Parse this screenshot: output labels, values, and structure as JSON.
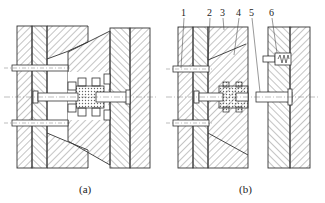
{
  "figure": {
    "type": "mold cross-section diagram",
    "panels": [
      {
        "id": "a",
        "caption": "(a)",
        "state": "mold closed"
      },
      {
        "id": "b",
        "caption": "(b)",
        "state": "mold open"
      }
    ],
    "callouts": [
      {
        "label": "1",
        "x": 183,
        "y": 13
      },
      {
        "label": "2",
        "x": 209,
        "y": 13
      },
      {
        "label": "3",
        "x": 222,
        "y": 13
      },
      {
        "label": "4",
        "x": 238,
        "y": 13
      },
      {
        "label": "5",
        "x": 251,
        "y": 13
      },
      {
        "label": "6",
        "x": 271,
        "y": 13
      }
    ],
    "colors": {
      "line": "#333333",
      "hatch": "#555555",
      "background": "#ffffff",
      "part_fill": "#e8e8e8"
    }
  }
}
